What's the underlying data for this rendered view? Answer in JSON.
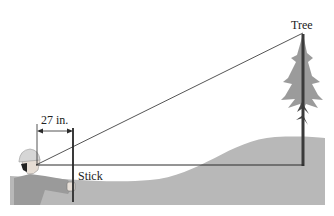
{
  "labels": {
    "tree": "Tree",
    "distance": "27 in.",
    "stick": "Stick"
  },
  "colors": {
    "ground": "#b8b8b8",
    "lines": "#2a2a2a",
    "tree_foliage": "#8a8a8a",
    "trunk": "#3a3a3a",
    "person_shirt": "#9a9a9a",
    "helmet": "#d6d6d6"
  },
  "geometry": {
    "eye": [
      36,
      165
    ],
    "tree_top": [
      303,
      33
    ],
    "tree_base": [
      303,
      165
    ],
    "stick_x": 73,
    "stick_top_y": 128,
    "stick_bottom_y": 202
  }
}
